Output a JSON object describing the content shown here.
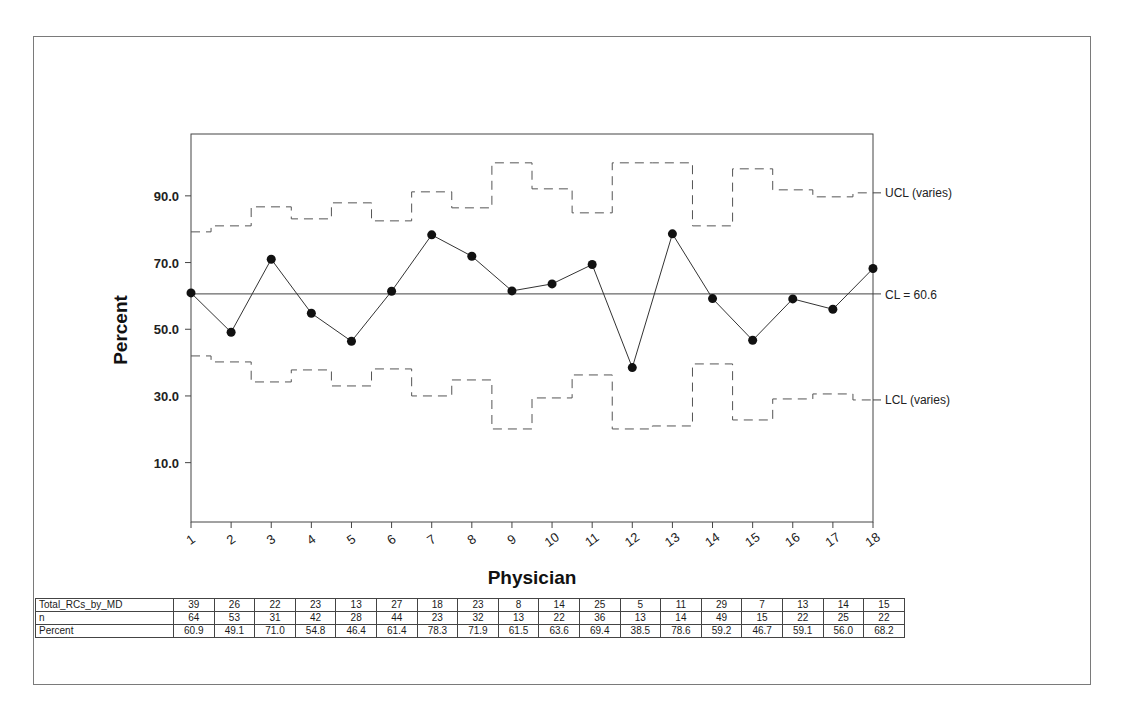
{
  "chart_data": {
    "type": "line",
    "subtype": "p-chart (control chart)",
    "title": "",
    "xlabel": "Physician",
    "ylabel": "Percent",
    "x": [
      1,
      2,
      3,
      4,
      5,
      6,
      7,
      8,
      9,
      10,
      11,
      12,
      13,
      14,
      15,
      16,
      17,
      18
    ],
    "x_tick_labels": [
      "1",
      "2",
      "3",
      "4",
      "5",
      "6",
      "7",
      "8",
      "9",
      "10",
      "11",
      "12",
      "13",
      "14",
      "15",
      "16",
      "17",
      "18"
    ],
    "y_ticks": [
      10.0,
      30.0,
      50.0,
      70.0,
      90.0
    ],
    "y_tick_labels": [
      "10.0",
      "30.0",
      "50.0",
      "70.0",
      "90.0"
    ],
    "ylim": [
      0,
      110
    ],
    "grid": false,
    "series": [
      {
        "name": "Percent",
        "style": "solid line with filled circle markers",
        "values": [
          60.9,
          49.1,
          71.0,
          54.8,
          46.4,
          61.4,
          78.3,
          71.9,
          61.5,
          63.6,
          69.4,
          38.5,
          78.6,
          59.2,
          46.7,
          59.1,
          56.0,
          68.2
        ]
      },
      {
        "name": "UCL (varies)",
        "style": "dashed step",
        "values": [
          79.2,
          81.0,
          86.7,
          83.1,
          87.9,
          82.5,
          91.2,
          86.4,
          99.9,
          92.1,
          84.9,
          99.9,
          99.9,
          81.0,
          98.1,
          91.8,
          89.7,
          90.9
        ]
      },
      {
        "name": "LCL (varies)",
        "style": "dashed step",
        "values": [
          42.0,
          40.2,
          34.2,
          37.8,
          33.0,
          38.1,
          30.0,
          34.8,
          20.1,
          29.4,
          36.3,
          20.1,
          21.0,
          39.6,
          22.8,
          29.1,
          30.6,
          28.8
        ]
      },
      {
        "name": "CL = 60.6",
        "style": "solid horizontal",
        "value": 60.6
      }
    ],
    "annotations": [
      "UCL (varies)",
      "CL = 60.6",
      "LCL (varies)"
    ],
    "table": {
      "rows": [
        {
          "label": "Total_RCs_by_MD",
          "values": [
            "39",
            "26",
            "22",
            "23",
            "13",
            "27",
            "18",
            "23",
            "8",
            "14",
            "25",
            "5",
            "11",
            "29",
            "7",
            "13",
            "14",
            "15"
          ]
        },
        {
          "label": "n",
          "values": [
            "64",
            "53",
            "31",
            "42",
            "28",
            "44",
            "23",
            "32",
            "13",
            "22",
            "36",
            "13",
            "14",
            "49",
            "15",
            "22",
            "25",
            "22"
          ]
        },
        {
          "label": "Percent",
          "values": [
            "60.9",
            "49.1",
            "71.0",
            "54.8",
            "46.4",
            "61.4",
            "78.3",
            "71.9",
            "61.5",
            "63.6",
            "69.4",
            "38.5",
            "78.6",
            "59.2",
            "46.7",
            "59.1",
            "56.0",
            "68.2"
          ]
        }
      ]
    }
  },
  "labels": {
    "ucl": "UCL (varies)",
    "cl": "CL = 60.6",
    "lcl": "LCL (varies)",
    "xlabel": "Physician",
    "ylabel": "Percent"
  }
}
